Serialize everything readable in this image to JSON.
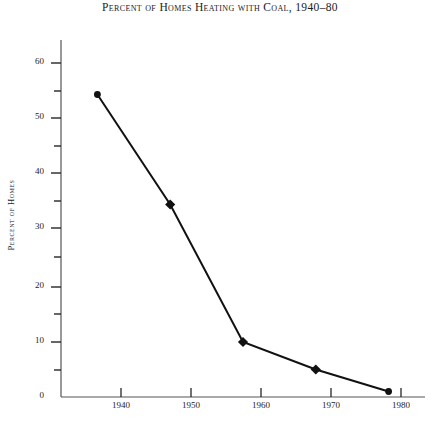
{
  "chart_data": {
    "type": "line",
    "title": "Percent of Homes Heating with Coal, 1940–80",
    "xlabel": "",
    "ylabel": "Percent of Homes",
    "x": [
      1940,
      1950,
      1960,
      1970,
      1980
    ],
    "values": [
      55,
      35,
      10,
      5,
      1
    ],
    "series": [
      {
        "name": "Percent of Homes Heating with Coal",
        "values": [
          55,
          35,
          10,
          5,
          1
        ]
      }
    ],
    "categories": [
      "1940",
      "1950",
      "1960",
      "1970",
      "1980"
    ],
    "xlim": [
      1935,
      1985
    ],
    "ylim": [
      0,
      63
    ],
    "x_tick_labels": [
      "1940",
      "1950",
      "1960",
      "1970",
      "1980"
    ],
    "y_tick_labels": [
      "0",
      "10",
      "20",
      "30",
      "40",
      "50",
      "60"
    ],
    "y_major_ticks": [
      0,
      10,
      20,
      30,
      40,
      50,
      60
    ],
    "y_minor_ticks": [
      5,
      15,
      25,
      35,
      45,
      55
    ],
    "grid": false,
    "legend": "none",
    "line_color": "#111111",
    "marker": "diamond",
    "marker_color": "#111111",
    "axis_color": "#4a4a4a"
  },
  "axes": {
    "y_title": "Percent of Homes",
    "y_labels": [
      {
        "value": "60",
        "y": 63
      },
      {
        "value": "50",
        "y": 118
      },
      {
        "value": "40",
        "y": 173
      },
      {
        "value": "30",
        "y": 228
      },
      {
        "value": "20",
        "y": 287
      },
      {
        "value": "10",
        "y": 342
      },
      {
        "value": "0",
        "y": 397
      }
    ],
    "x_labels": [
      {
        "value": "1940",
        "x": 121
      },
      {
        "value": "1950",
        "x": 191
      },
      {
        "value": "1960",
        "x": 261
      },
      {
        "value": "1970",
        "x": 331
      },
      {
        "value": "1980",
        "x": 401
      }
    ]
  }
}
